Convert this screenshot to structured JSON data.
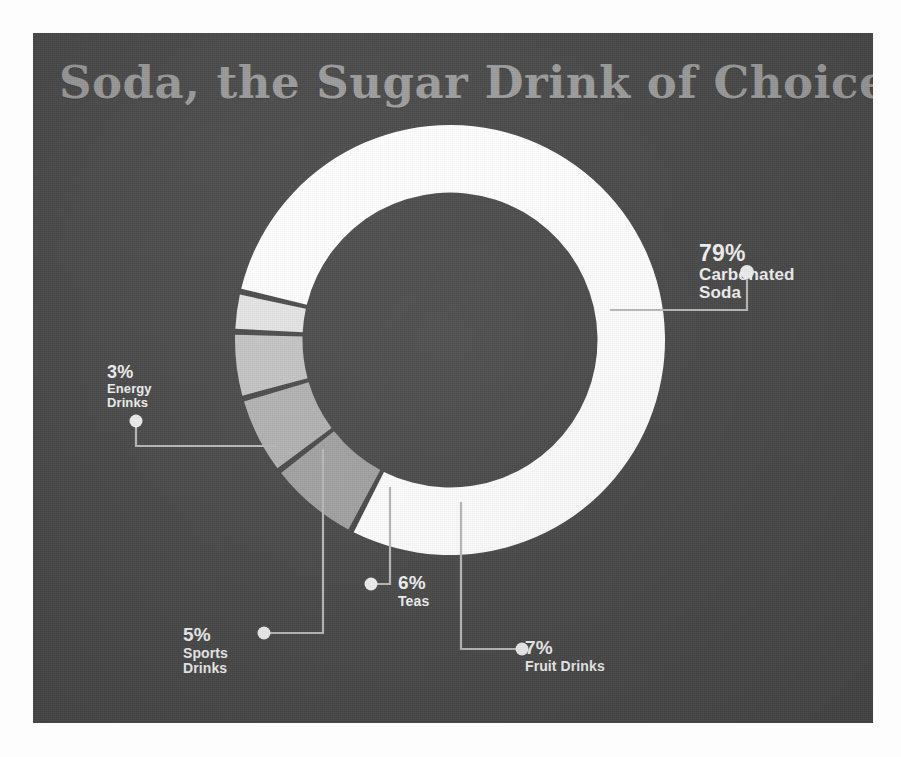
{
  "page": {
    "background_color": "#fdfdfd",
    "panel_color": "#4b4b4b"
  },
  "title": {
    "text": "Soda, the Sugar Drink of Choice",
    "color": "#9d9d9d"
  },
  "chart_data": {
    "type": "pie",
    "variant": "donut",
    "title": "Soda, the Sugar Drink of Choice",
    "xlabel": "",
    "ylabel": "",
    "unit": "%",
    "legend": "none",
    "grid": false,
    "labels_inline": true,
    "categories": [
      "Carbonated Soda",
      "Fruit Drinks",
      "Teas",
      "Sports Drinks",
      "Energy Drinks"
    ],
    "values": [
      79,
      7,
      6,
      5,
      3
    ],
    "colors": [
      "#ffffff",
      "#a2a2a2",
      "#b2b2b2",
      "#c4c4c4",
      "#e4e4e4"
    ],
    "slices": [
      {
        "label": "Carbonated Soda",
        "value": 79,
        "display": "79%",
        "color": "#ffffff"
      },
      {
        "label": "Fruit Drinks",
        "value": 7,
        "display": "7%",
        "color": "#a2a2a2"
      },
      {
        "label": "Teas",
        "value": 6,
        "display": "6%",
        "color": "#b2b2b2"
      },
      {
        "label": "Sports Drinks",
        "value": 5,
        "display": "5%",
        "color": "#c4c4c4"
      },
      {
        "label": "Energy Drinks",
        "value": 3,
        "display": "3%",
        "color": "#e4e4e4"
      }
    ]
  },
  "callouts": {
    "carbonated": {
      "pct": "79%",
      "name_line1": "Carbonated",
      "name_line2": "Soda"
    },
    "energy": {
      "pct": "3%",
      "name_line1": "Energy",
      "name_line2": "Drinks"
    },
    "sports": {
      "pct": "5%",
      "name_line1": "Sports",
      "name_line2": "Drinks"
    },
    "teas": {
      "pct": "6%",
      "name_line1": "Teas",
      "name_line2": ""
    },
    "fruit": {
      "pct": "7%",
      "name_line1": "Fruit Drinks",
      "name_line2": ""
    }
  }
}
